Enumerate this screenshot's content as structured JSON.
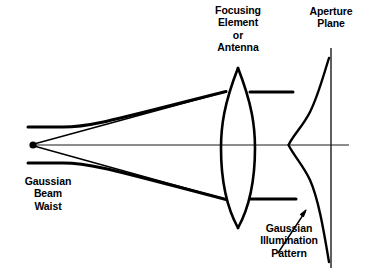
{
  "figure": {
    "kind": "optics-ray-diagram",
    "background_color": "#ffffff",
    "stroke_color": "#000000",
    "axis_color": "#1a1a1a"
  },
  "labels": {
    "focusing_element": "Focusing\nElement\nor\nAntenna",
    "aperture_plane": "Aperture\nPlane",
    "gaussian_beam_waist": "Gaussian\nBeam\nWaist",
    "gaussian_illumination": "Gaussian\nIllumination\nPattern"
  },
  "elements": {
    "beam_waist_point": "beam-waist-dot",
    "optical_axis": "optical-axis-line",
    "lens": "biconvex-lens",
    "aperture_plane_line": "aperture-plane-vertical-line",
    "gaussian_curve": "gaussian-illumination-curve",
    "pointer_arrow": "gaussian-illumination-arrow",
    "upper_diverging_ray": "upper-diverging-ray",
    "lower_diverging_ray": "lower-diverging-ray",
    "upper_waist_envelope": "upper-beam-envelope",
    "lower_waist_envelope": "lower-beam-envelope",
    "upper_collimated_ray": "upper-collimated-ray",
    "lower_collimated_ray": "lower-collimated-ray"
  },
  "geometry": {
    "waist_dot": {
      "x": 33,
      "y": 145,
      "r": 3.6
    },
    "optical_axis": {
      "x1": 33,
      "y1": 145,
      "x2": 349,
      "y2": 145
    },
    "lens": {
      "cx": 238,
      "top_y": 68,
      "bottom_y": 228,
      "half_width": 17
    },
    "aperture_line": {
      "x": 331,
      "y1": 48,
      "y2": 268
    },
    "gaussian": {
      "peak_x": 288,
      "peak_y": 145,
      "tail_x": 331,
      "top_y": 58,
      "bottom_y": 262
    },
    "upper_ray": {
      "x1": 33,
      "y1": 145,
      "x2": 226,
      "y2": 92
    },
    "lower_ray": {
      "x1": 33,
      "y1": 145,
      "x2": 226,
      "y2": 199
    },
    "upper_collimated": {
      "x1": 250,
      "y1": 92,
      "x2": 293,
      "y2": 92
    },
    "lower_collimated": {
      "x1": 250,
      "y1": 199,
      "x2": 296,
      "y2": 199
    },
    "arrow": {
      "x1": 278,
      "y1": 253,
      "x2": 306,
      "y2": 211
    }
  }
}
